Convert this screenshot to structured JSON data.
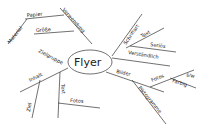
{
  "mindmap": {
    "center": "Flyer",
    "branches": {
      "material": "Material",
      "papier": "Papier",
      "groesse": "Größe",
      "verwendung": "Verwendung",
      "zielgruppe": "Zielgruppe",
      "inhalt": "Inhalt",
      "ziel": "Ziel",
      "text_left": "Text",
      "fotos_left": "Fotos",
      "schriftart": "Schriftart",
      "text_right": "Text",
      "serioes": "Seriös",
      "verstaendlich": "Verständlich",
      "bilder": "Bilder",
      "piktogramme": "Piktogramme",
      "fotos_right": "Fotos",
      "sw": "s/w",
      "farbig": "Farbig"
    }
  }
}
